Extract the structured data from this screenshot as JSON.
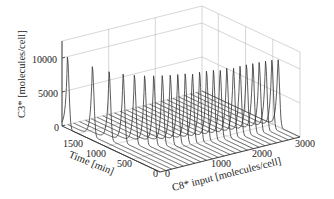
{
  "chart_data": {
    "type": "waterfall-3d",
    "title": "",
    "zlabel": "C3* [molecules/cell]",
    "ylabel": "Time [min]",
    "xlabel": "C8* input [molecules/cell]",
    "z_ticks": [
      "0",
      "5000",
      "10000"
    ],
    "y_ticks": [
      "1500",
      "1000",
      "500",
      "0"
    ],
    "x_ticks": [
      "0",
      "1000",
      "2000",
      "3000"
    ],
    "zlim": [
      0,
      12500
    ],
    "ylim": [
      0,
      1800
    ],
    "xlim": [
      0,
      3000
    ],
    "grid": true,
    "legend": null,
    "series_description": "One C3* time trace per C8* input level; each trace is ~0 then rises to a sharp peak near 10000 molecules/cell and decays. Peak time decreases as C8* input increases.",
    "x": [
      0,
      125,
      250,
      375,
      500,
      625,
      750,
      875,
      1000,
      1125,
      1250,
      1375,
      1500,
      1625,
      1750,
      1875,
      2000,
      2125,
      2250,
      2375,
      2500,
      2625,
      2750,
      2875,
      3000
    ],
    "peak_time_min": [
      1700,
      1350,
      1150,
      1000,
      900,
      820,
      760,
      710,
      670,
      640,
      610,
      585,
      560,
      540,
      520,
      505,
      490,
      475,
      462,
      450,
      440,
      430,
      420,
      412,
      405
    ],
    "peak_value": [
      10500,
      10200,
      10000,
      10000,
      10000,
      10000,
      10000,
      10000,
      10000,
      10000,
      10000,
      10000,
      10000,
      10000,
      10000,
      10000,
      10000,
      10000,
      10000,
      10000,
      10000,
      10000,
      10000,
      10000,
      10000
    ]
  }
}
